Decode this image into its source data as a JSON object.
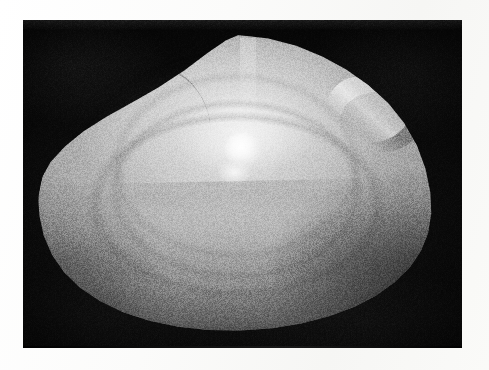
{
  "page": {
    "background_color": "#ffffff",
    "width": 489,
    "height": 370
  },
  "figure": {
    "name": "shell-photograph",
    "caption": "",
    "description": "Black-and-white photograph of a single bivalve clam shell valve on a black background"
  },
  "photo": {
    "frame": {
      "left": 23,
      "top": 20,
      "width": 439,
      "height": 328
    },
    "background_color": "#0a0a0a",
    "margin_color": "#fdfdfc",
    "is_grayscale": true
  },
  "shell": {
    "outline": {
      "left": 37,
      "top": 35,
      "width": 399,
      "height": 298
    },
    "apex_point": {
      "x": 265,
      "y": 38
    },
    "left_extremity": {
      "x": 41,
      "y": 201
    },
    "right_extremity": {
      "x": 435,
      "y": 191
    },
    "lowest_point": {
      "x": 232,
      "y": 332
    },
    "tone_light": "#d2d2d2",
    "tone_mid": "#9b9b9b",
    "tone_dark": "#7b7b7b",
    "features": [
      {
        "name": "umbo",
        "label": "umbo (beak)"
      },
      {
        "name": "specular-highlight-primary",
        "label": "primary specular highlight"
      },
      {
        "name": "specular-highlight-secondary",
        "label": "secondary specular highlight"
      },
      {
        "name": "growth-band",
        "label": "major concentric growth band"
      },
      {
        "name": "dorsal-ridge-left",
        "label": "anterior dorsal margin groove"
      },
      {
        "name": "dorsal-ridge-right",
        "label": "posterior dorsal margin ridge"
      },
      {
        "name": "ventral-margin",
        "label": "ventral margin"
      }
    ]
  },
  "highlights": {
    "primary": {
      "x": 237,
      "y": 127,
      "intensity": "#ffffff"
    },
    "secondary": {
      "x": 230,
      "y": 152,
      "intensity": "#f2f2f2"
    }
  }
}
